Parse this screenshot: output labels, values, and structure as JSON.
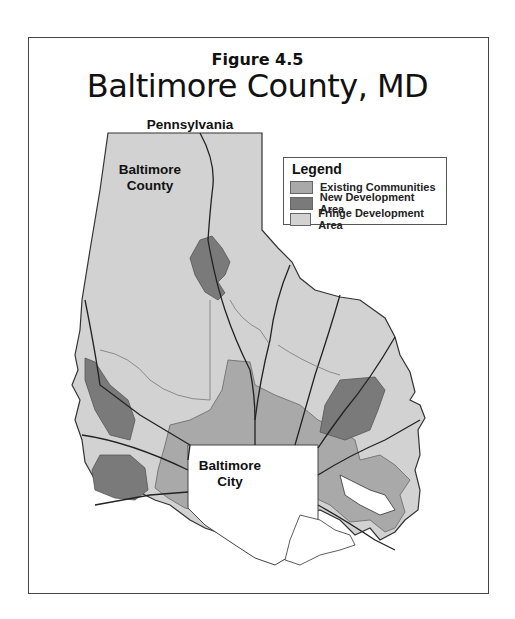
{
  "figure": {
    "label": "Figure 4.5",
    "title": "Baltimore County, MD"
  },
  "map_labels": {
    "north_border": "Pennsylvania",
    "county": "Baltimore\nCounty",
    "county_line1": "Baltimore",
    "county_line2": "County",
    "city_line1": "Baltimore",
    "city_line2": "City"
  },
  "legend": {
    "title": "Legend",
    "items": [
      {
        "label": "Existing Communities",
        "color": "#a9a9a9"
      },
      {
        "label": "New Development Area",
        "color": "#7a7a7a"
      },
      {
        "label": "Fringe Development Area",
        "color": "#d2d2d2"
      }
    ]
  },
  "colors": {
    "frame": "#444444",
    "roads": "#222222",
    "outline": "#333333",
    "city": "#ffffff"
  }
}
